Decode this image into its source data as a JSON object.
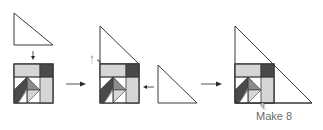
{
  "caption": "Make 8",
  "colors": {
    "outline": "#3a3a3a",
    "light_gray": "#d6d6d6",
    "dark_gray": "#4a4a4a",
    "mid_gray": "#8c8c8c",
    "white": "#ffffff",
    "arrow": "#2a2a2a",
    "faint_arrow": "#b0b0b0",
    "text": "#6a6a6a"
  },
  "steps": [
    {
      "label": "step-1",
      "parts": [
        "triangle",
        "down-arrow",
        "block"
      ]
    },
    {
      "label": "step-2",
      "parts": [
        "block-with-triangle-on-top",
        "triangle-right"
      ]
    },
    {
      "label": "step-3",
      "parts": [
        "block-in-large-triangle"
      ]
    }
  ]
}
